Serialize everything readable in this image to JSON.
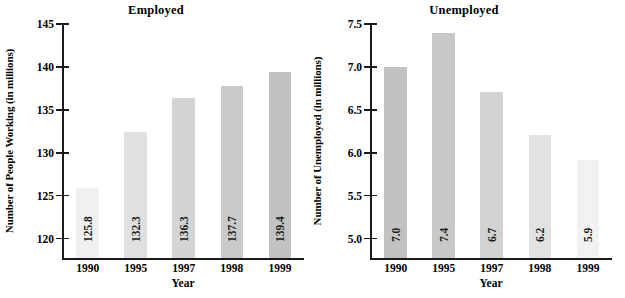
{
  "chart_data": [
    {
      "type": "bar",
      "title": "Employed",
      "xlabel": "Year",
      "ylabel": "Number of People Working (in millions)",
      "categories": [
        "1990",
        "1995",
        "1997",
        "1998",
        "1999"
      ],
      "values": [
        125.8,
        132.3,
        136.3,
        137.7,
        139.4
      ],
      "value_labels": [
        "125.8",
        "132.3",
        "136.3",
        "137.7",
        "139.4"
      ],
      "ylim": [
        117.5,
        145
      ],
      "yticks": [
        120,
        125,
        130,
        135,
        140,
        145
      ],
      "ytick_labels": [
        "120",
        "125",
        "130",
        "135",
        "140",
        "145"
      ],
      "bar_colors": [
        "#f0f0f0",
        "#e0e0e0",
        "#d4d4d4",
        "#cacaca",
        "#c2c2c2"
      ],
      "grid": false,
      "legend": "none"
    },
    {
      "type": "bar",
      "title": "Unemployed",
      "xlabel": "Year",
      "ylabel": "Number of Unemployed (in millions)",
      "categories": [
        "1990",
        "1995",
        "1997",
        "1998",
        "1999"
      ],
      "values": [
        7.0,
        7.4,
        6.7,
        6.2,
        5.9
      ],
      "value_labels": [
        "7.0",
        "7.4",
        "6.7",
        "6.2",
        "5.9"
      ],
      "ylim": [
        4.75,
        7.5
      ],
      "yticks": [
        5.0,
        5.5,
        6.0,
        6.5,
        7.0,
        7.5
      ],
      "ytick_labels": [
        "5.0",
        "5.5",
        "6.0",
        "6.5",
        "7.0",
        "7.5"
      ],
      "bar_colors": [
        "#c2c2c2",
        "#c8c8c8",
        "#d2d2d2",
        "#e2e2e2",
        "#f2f2f2"
      ],
      "grid": false,
      "legend": "none"
    }
  ]
}
